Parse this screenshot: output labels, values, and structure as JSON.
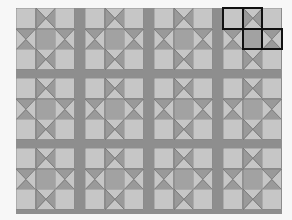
{
  "puzzle": {
    "type": "quilt-block-grid",
    "columns": 4,
    "rows": 3,
    "block_pattern": "ohio-star",
    "colors": {
      "background": "#f7f7f7",
      "sashing": "#8e8e8e",
      "light": "#c6c6c6",
      "dark": "#9a9a9a",
      "center": "#a2a2a2",
      "seam": "#707070",
      "highlight": "#111111"
    },
    "highlighted_cells": [
      {
        "block_row": 0,
        "block_col": 3,
        "cell_row": 0,
        "cell_col": 0
      },
      {
        "block_row": 0,
        "block_col": 3,
        "cell_row": 0,
        "cell_col": 1
      },
      {
        "block_row": 0,
        "block_col": 3,
        "cell_row": 1,
        "cell_col": 1
      },
      {
        "block_row": 0,
        "block_col": 3,
        "cell_row": 1,
        "cell_col": 2
      }
    ]
  }
}
